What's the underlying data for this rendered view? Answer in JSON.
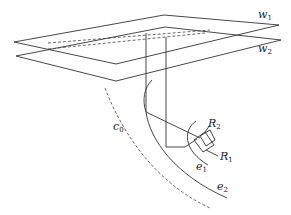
{
  "diagram": {
    "labels": {
      "w1": {
        "base": "w",
        "sub": "1"
      },
      "w2": {
        "base": "w",
        "sub": "2"
      },
      "c0": {
        "base": "c",
        "sub": "0"
      },
      "e1": {
        "base": "e",
        "sub": "1"
      },
      "e2": {
        "base": "e",
        "sub": "2"
      },
      "R1": {
        "base": "R",
        "sub": "1"
      },
      "R2": {
        "base": "R",
        "sub": "2"
      }
    },
    "colors": {
      "line": "#333333",
      "background": "#ffffff"
    }
  }
}
